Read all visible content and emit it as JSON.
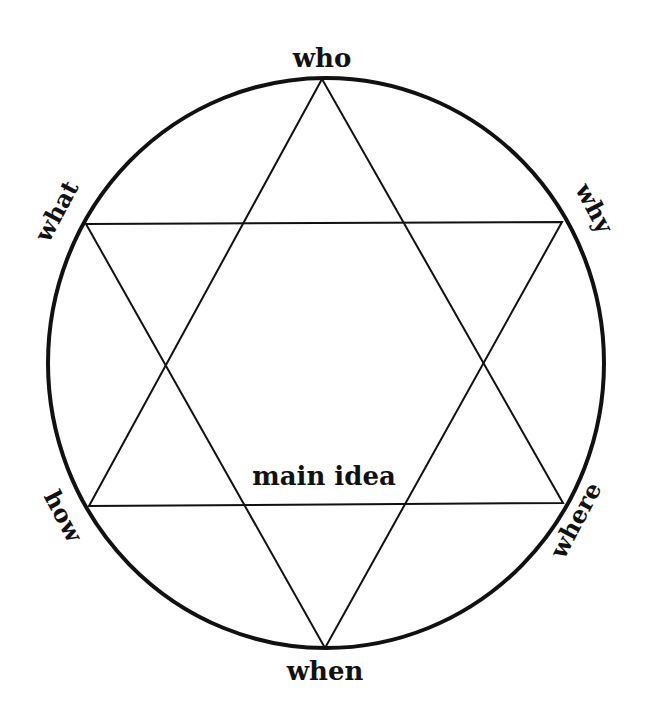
{
  "diagram": {
    "title": "",
    "center_label": "main idea",
    "vertex_labels": {
      "top": "who",
      "upper_left": "what",
      "upper_right": "why",
      "lower_left": "how",
      "lower_right": "where",
      "bottom": "when"
    },
    "colors": {
      "background": "#ffffff",
      "stroke": "#111111",
      "text": "#111111"
    }
  }
}
